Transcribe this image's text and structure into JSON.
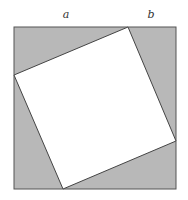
{
  "diagram": {
    "labels": {
      "a": "a",
      "b": "b"
    },
    "colors": {
      "shaded": "#b8b8b8",
      "inner": "#ffffff",
      "stroke": "#444444"
    }
  }
}
